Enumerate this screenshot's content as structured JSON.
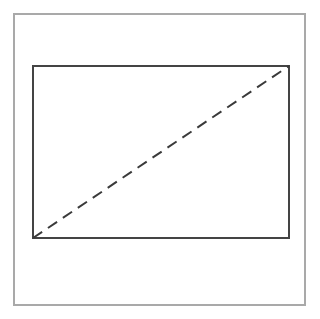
{
  "figure": {
    "canvas": {
      "width": 320,
      "height": 319,
      "background_color": "#ffffff"
    },
    "shapes": [
      {
        "name": "outer-frame",
        "type": "rectangle",
        "label": "Outer border frame",
        "x": 14,
        "y": 14,
        "width": 291,
        "height": 291,
        "stroke_color": "#a9a9a9",
        "stroke_width": 2.5,
        "fill": "none",
        "line_style": "solid"
      },
      {
        "name": "inner-rectangle",
        "type": "rectangle",
        "label": "Inner rectangle",
        "x": 33,
        "y": 66,
        "width": 256,
        "height": 172,
        "stroke_color": "#444444",
        "stroke_width": 1.5,
        "fill": "none",
        "line_style": "solid"
      },
      {
        "name": "diagonal-line",
        "type": "line",
        "label": "Dashed diagonal",
        "x1": 33,
        "y1": 238,
        "x2": 289,
        "y2": 66,
        "stroke_color": "#3a3a3a",
        "stroke_width": 2,
        "line_style": "dashed",
        "dash_pattern": "11 7"
      }
    ]
  }
}
